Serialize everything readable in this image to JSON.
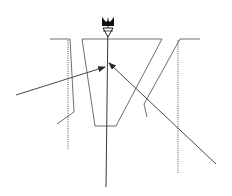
{
  "diagram": {
    "type": "channel cross-section with water level marker and force arrows",
    "colors": {
      "line": "#6e6e6e",
      "axis": "#3a3a3a",
      "marker": "#111111",
      "background": "#ffffff"
    },
    "water_level_marker": {
      "symbol": "inverted-triangle",
      "x": 108,
      "y": 39
    },
    "ground_line_y": 39,
    "left_bank": {
      "surface": [
        [
          50,
          39
        ],
        [
          70,
          39
        ]
      ],
      "wall": [
        [
          70,
          39
        ],
        [
          74,
          112
        ],
        [
          57,
          124
        ]
      ],
      "dotted_reference": [
        [
          68,
          39
        ],
        [
          68,
          150
        ]
      ]
    },
    "right_bank": {
      "surface": [
        [
          180,
          39
        ],
        [
          200,
          39
        ]
      ],
      "wall": [
        [
          180,
          39
        ],
        [
          144,
          104
        ],
        [
          147,
          117
        ]
      ],
      "dotted_reference": [
        [
          178,
          39
        ],
        [
          178,
          174
        ]
      ]
    },
    "channel": {
      "points": [
        [
          82,
          39
        ],
        [
          162,
          39
        ],
        [
          116,
          126
        ],
        [
          95,
          126
        ]
      ]
    },
    "center_axis": [
      [
        108,
        18
      ],
      [
        106,
        187
      ]
    ],
    "arrows": [
      {
        "from": [
          16,
          95
        ],
        "to": [
          105,
          67
        ]
      },
      {
        "from": [
          216,
          164
        ],
        "to": [
          109,
          63
        ]
      }
    ]
  }
}
